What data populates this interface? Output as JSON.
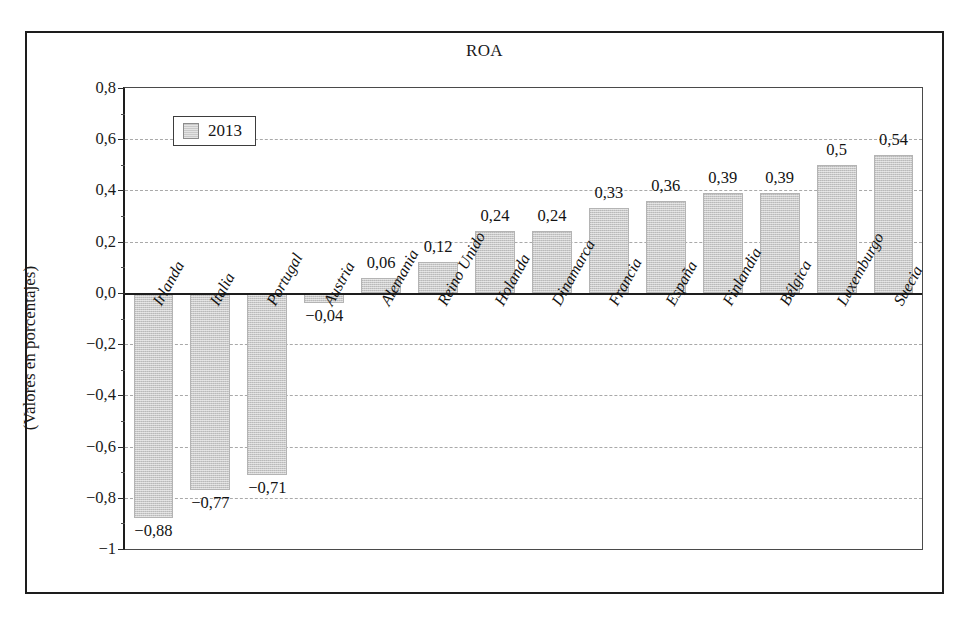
{
  "figure": {
    "title": "ROA",
    "y_axis_title": "(Valores en porcentajes)"
  },
  "legend": {
    "series_label": "2013",
    "swatch_color": "#c9c9c9"
  },
  "axis": {
    "tick_labels": [
      "0,8",
      "0,6",
      "0,4",
      "0,2",
      "0,0",
      "−0,2",
      "−0,4",
      "−0,6",
      "−0,8",
      "−1"
    ]
  },
  "chart_data": {
    "type": "bar",
    "title": "ROA",
    "xlabel": "",
    "ylabel": "(Valores en porcentajes)",
    "ylim": [
      -1,
      0.8
    ],
    "ytick_values": [
      0.8,
      0.6,
      0.4,
      0.2,
      0.0,
      -0.2,
      -0.4,
      -0.6,
      -0.8,
      -1
    ],
    "ytick_labels": [
      "0,8",
      "0,6",
      "0,4",
      "0,2",
      "0,0",
      "−0,2",
      "−0,4",
      "−0,6",
      "−0,8",
      "−1"
    ],
    "grid": true,
    "grid_axis": "y",
    "legend_position": "top-left",
    "bar_color": "#c9c9c9",
    "categories": [
      "Irlanda",
      "Italia",
      "Portugal",
      "Austria",
      "Alemania",
      "Reino Unido",
      "Holanda",
      "Dinamarca",
      "Francia",
      "España",
      "Finlandia",
      "Bélgica",
      "Luxemburgo",
      "Suecia"
    ],
    "series": [
      {
        "name": "2013",
        "values": [
          -0.88,
          -0.77,
          -0.71,
          -0.04,
          0.06,
          0.12,
          0.24,
          0.24,
          0.33,
          0.36,
          0.39,
          0.39,
          0.5,
          0.54
        ],
        "data_labels": [
          "−0,88",
          "−0,77",
          "−0,71",
          "−0,04",
          "0,06",
          "0,12",
          "0,24",
          "0,24",
          "0,33",
          "0,36",
          "0,39",
          "0,39",
          "0,5",
          "0,54"
        ]
      }
    ]
  }
}
